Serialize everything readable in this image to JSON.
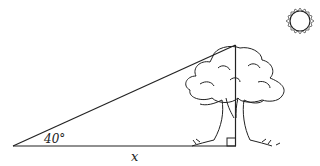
{
  "diagram": {
    "angle_label": "40°",
    "base_label": "x",
    "line_color": "#222222",
    "elements": [
      "right-triangle",
      "tree",
      "sun",
      "right-angle-marker"
    ]
  }
}
